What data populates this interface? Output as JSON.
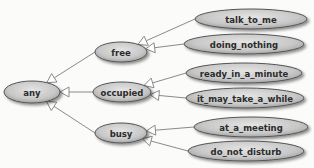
{
  "diagram": {
    "type": "hierarchy",
    "direction": "children point to parent with hollow triangle arrows (generalization)",
    "colors": {
      "background": "#fbfbfa",
      "node_fill_center": "#e2e2e2",
      "node_fill_edge": "#a9a9a9",
      "node_stroke": "#555555",
      "edge": "#8a8a8a",
      "arrowhead_fill": "#ffffff",
      "text": "#2b2b2b"
    },
    "nodes": [
      {
        "id": "any",
        "label": "any",
        "cx": 32,
        "cy": 92,
        "rx": 28,
        "ry": 11
      },
      {
        "id": "free",
        "label": "free",
        "cx": 121,
        "cy": 52,
        "rx": 26,
        "ry": 10
      },
      {
        "id": "occupied",
        "label": "occupied",
        "cx": 122,
        "cy": 92,
        "rx": 29,
        "ry": 10
      },
      {
        "id": "busy",
        "label": "busy",
        "cx": 121,
        "cy": 133,
        "rx": 26,
        "ry": 10
      },
      {
        "id": "talk_to_me",
        "label": "talk_to_me",
        "cx": 251,
        "cy": 19,
        "rx": 56,
        "ry": 10
      },
      {
        "id": "doing_nothing",
        "label": "doing_nothing",
        "cx": 244,
        "cy": 44,
        "rx": 60,
        "ry": 10
      },
      {
        "id": "ready_in_a_minute",
        "label": "ready_in_a_minute",
        "cx": 244,
        "cy": 73,
        "rx": 58,
        "ry": 10
      },
      {
        "id": "it_may_take_a_while",
        "label": "it_may_take_a_while",
        "cx": 245,
        "cy": 98,
        "rx": 59,
        "ry": 10
      },
      {
        "id": "at_a_meeting",
        "label": "at_a_meeting",
        "cx": 251,
        "cy": 127,
        "rx": 57,
        "ry": 10
      },
      {
        "id": "do_not_disturb",
        "label": "do_not_disturb",
        "cx": 246,
        "cy": 151,
        "rx": 58,
        "ry": 10
      }
    ],
    "edges": [
      {
        "from": "free",
        "to": "any"
      },
      {
        "from": "occupied",
        "to": "any"
      },
      {
        "from": "busy",
        "to": "any"
      },
      {
        "from": "talk_to_me",
        "to": "free"
      },
      {
        "from": "doing_nothing",
        "to": "free"
      },
      {
        "from": "ready_in_a_minute",
        "to": "occupied"
      },
      {
        "from": "it_may_take_a_while",
        "to": "occupied"
      },
      {
        "from": "at_a_meeting",
        "to": "busy"
      },
      {
        "from": "do_not_disturb",
        "to": "busy"
      }
    ]
  },
  "labels": {
    "any": "any",
    "free": "free",
    "occupied": "occupied",
    "busy": "busy",
    "talk_to_me": "talk_to_me",
    "doing_nothing": "doing_nothing",
    "ready_in_a_minute": "ready_in_a_minute",
    "it_may_take_a_while": "it_may_take_a_while",
    "at_a_meeting": "at_a_meeting",
    "do_not_disturb": "do_not_disturb"
  }
}
